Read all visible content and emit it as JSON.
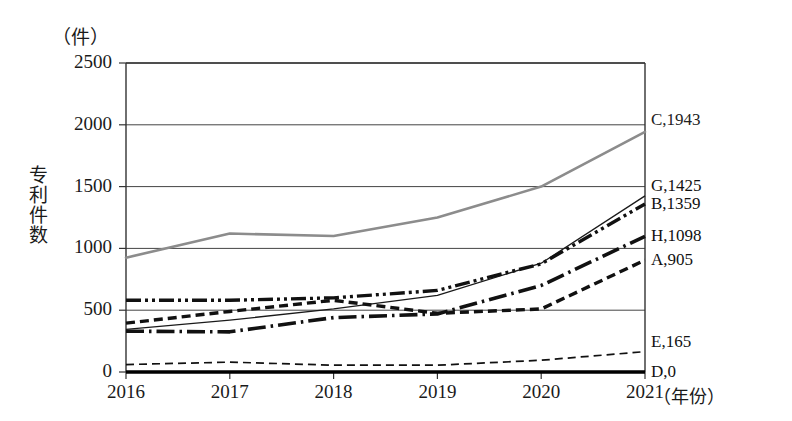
{
  "chart_data": {
    "type": "line",
    "title": "",
    "unit_label": "（件）",
    "ylabel": "专利件数",
    "xlabel": "（年份）",
    "x": [
      "2016",
      "2017",
      "2018",
      "2019",
      "2020",
      "2021"
    ],
    "categories": [
      "2016",
      "2017",
      "2018",
      "2019",
      "2020",
      "2021"
    ],
    "ylim": [
      0,
      2500
    ],
    "yticks": [
      "0",
      "500",
      "1000",
      "1500",
      "2000",
      "2500"
    ],
    "ytick_values": [
      0,
      500,
      1000,
      1500,
      2000,
      2500
    ],
    "grid": true,
    "legend_position": "right-inline-end-labels",
    "series": [
      {
        "name": "C",
        "end_label": "C,1943",
        "end_value": 1943,
        "color": "#8c8c8c",
        "style": "solid-gray",
        "values": [
          925,
          1120,
          1100,
          1250,
          1500,
          1943
        ]
      },
      {
        "name": "G",
        "end_label": "G,1425",
        "end_value": 1425,
        "color": "#1a1a1a",
        "style": "thin-solid",
        "values": [
          345,
          420,
          510,
          620,
          880,
          1425
        ]
      },
      {
        "name": "B",
        "end_label": "B,1359",
        "end_value": 1359,
        "color": "#111111",
        "style": "dash-dot-dot",
        "values": [
          580,
          580,
          600,
          660,
          875,
          1359
        ]
      },
      {
        "name": "H",
        "end_label": "H,1098",
        "end_value": 1098,
        "color": "#111111",
        "style": "dash-dot",
        "values": [
          330,
          325,
          440,
          470,
          700,
          1098
        ]
      },
      {
        "name": "A",
        "end_label": "A,905",
        "end_value": 905,
        "color": "#111111",
        "style": "dashed-thick",
        "values": [
          395,
          490,
          580,
          475,
          510,
          905
        ]
      },
      {
        "name": "E",
        "end_label": "E,165",
        "end_value": 165,
        "color": "#111111",
        "style": "dashed-thin",
        "values": [
          60,
          80,
          55,
          55,
          95,
          165
        ]
      },
      {
        "name": "D",
        "end_label": "D,0",
        "end_value": 0,
        "color": "#000000",
        "style": "solid-thick",
        "values": [
          0,
          0,
          0,
          0,
          0,
          0
        ]
      }
    ]
  },
  "axes": {
    "frame_color": "#333333",
    "gridline_color": "#444444"
  }
}
